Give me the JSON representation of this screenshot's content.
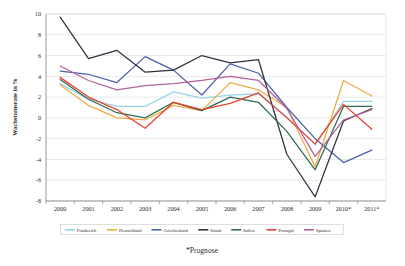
{
  "chart_data": {
    "type": "line",
    "title": "",
    "xlabel": "",
    "ylabel": "Wachstumsrate in %",
    "ylim": [
      -8,
      10
    ],
    "ytick_step": 2,
    "yticks": [
      10,
      8,
      6,
      4,
      2,
      0,
      -2,
      -4,
      -6,
      -8
    ],
    "ytick_labels": [
      "10",
      "8",
      "6",
      "4",
      "2",
      "0",
      "-2",
      "-4",
      "-6",
      "-8"
    ],
    "grid": true,
    "legend_position": "bottom",
    "footnote": "*Prognose",
    "categories": [
      "2000",
      "2001",
      "2002",
      "2003",
      "2004",
      "2005",
      "2006",
      "2007",
      "2008",
      "2009",
      "2010*",
      "2011*"
    ],
    "x": [
      2000,
      2001,
      2002,
      2003,
      2004,
      2005,
      2006,
      2007,
      2008,
      2009,
      2010,
      2011
    ],
    "series": [
      {
        "name": "Frankreich",
        "color": "#92d4e8",
        "values": [
          3.3,
          1.8,
          1.1,
          1.1,
          2.5,
          1.9,
          2.2,
          2.3,
          0.1,
          -2.6,
          1.6,
          1.6
        ]
      },
      {
        "name": "Deutschland",
        "color": "#eeaa44",
        "values": [
          3.2,
          1.2,
          0.0,
          -0.2,
          1.2,
          0.7,
          3.4,
          2.7,
          1.0,
          -4.7,
          3.6,
          2.1
        ]
      },
      {
        "name": "Griechenland",
        "color": "#4d5fa8",
        "values": [
          4.5,
          4.2,
          3.4,
          5.9,
          4.6,
          2.2,
          5.2,
          4.3,
          1.0,
          -2.0,
          -4.3,
          -3.1
        ]
      },
      {
        "name": "Irland",
        "color": "#2f3442",
        "values": [
          9.7,
          5.7,
          6.5,
          4.4,
          4.6,
          6.0,
          5.3,
          5.6,
          -3.5,
          -7.6,
          -0.3,
          0.9
        ]
      },
      {
        "name": "Italien",
        "color": "#2f6b52",
        "values": [
          3.7,
          1.8,
          0.5,
          0.0,
          1.5,
          0.7,
          2.0,
          1.5,
          -1.3,
          -5.0,
          1.1,
          1.1
        ]
      },
      {
        "name": "Portugal",
        "color": "#e8412a",
        "values": [
          3.9,
          2.0,
          0.8,
          -1.0,
          1.5,
          0.8,
          1.4,
          2.4,
          0.0,
          -2.5,
          1.3,
          -1.1
        ]
      },
      {
        "name": "Spanien",
        "color": "#b4619a",
        "values": [
          5.0,
          3.6,
          2.7,
          3.1,
          3.3,
          3.6,
          4.0,
          3.6,
          0.9,
          -3.7,
          -0.2,
          0.8
        ]
      }
    ]
  },
  "axis": {
    "y_title": "Wachstumsrate in %"
  },
  "footnote": {
    "text": "*Prognose"
  }
}
